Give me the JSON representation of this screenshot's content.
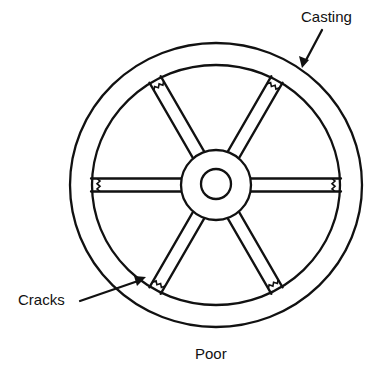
{
  "figure": {
    "caption": "Poor",
    "labels": {
      "casting": "Casting",
      "cracks": "Cracks"
    }
  },
  "wheel": {
    "center": [
      216,
      185
    ],
    "outer_rim": {
      "rx": 146,
      "ry": 142
    },
    "inner_rim": {
      "rx": 124,
      "ry": 120
    },
    "hub_radius": 35,
    "axle_radius": 15,
    "spoke_count": 6,
    "spoke_angles_deg": [
      0,
      60,
      120,
      180,
      240,
      300
    ],
    "spoke_width": 13,
    "cracks_at_rim_end_of_each_spoke": true
  },
  "colors": {
    "ink": "#111111",
    "background": "#ffffff"
  }
}
